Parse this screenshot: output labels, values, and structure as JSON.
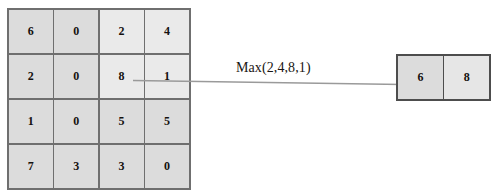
{
  "diagram": {
    "input": {
      "name": "input-feature-map",
      "rows": 4,
      "cols": 4,
      "values": [
        [
          "6",
          "0",
          "2",
          "4"
        ],
        [
          "2",
          "0",
          "8",
          "1"
        ],
        [
          "1",
          "0",
          "5",
          "5"
        ],
        [
          "7",
          "3",
          "3",
          "0"
        ]
      ],
      "pool_window": {
        "row_start": 0,
        "row_end": 1,
        "col_start": 2,
        "col_end": 3,
        "values": [
          "2",
          "4",
          "8",
          "1"
        ],
        "highlight_color": "#eaeaea"
      },
      "cell_color": "#dcdcdc",
      "border_color": "#6f6f6f"
    },
    "annotation": {
      "name": "pool-operation-label",
      "text": "Max(2,4,8,1)"
    },
    "arrow": {
      "name": "pool-arrow",
      "color": "#8f8f8f",
      "from_x": 133,
      "from_y": 81,
      "to_x": 442,
      "to_y": 85
    },
    "output": {
      "name": "output-feature-map",
      "rows": 1,
      "cols": 2,
      "values": [
        [
          "6",
          "8"
        ]
      ],
      "result_index": 1,
      "cell_color": "#dcdcdc",
      "border_color": "#4d4d4d"
    }
  }
}
